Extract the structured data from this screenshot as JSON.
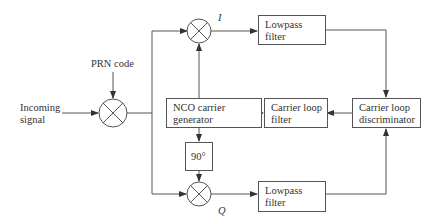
{
  "diagram": {
    "title": "",
    "inputs": {
      "incoming_signal": "Incoming\nsignal",
      "prn_code": "PRN code"
    },
    "branch_labels": {
      "i": "I",
      "q": "Q"
    },
    "blocks": {
      "lowpass_i": "Lowpass\nfilter",
      "lowpass_q": "Lowpass\nfilter",
      "nco": "NCO carrier\ngenerator",
      "loop_filter": "Carrier loop\nfilter",
      "discriminator": "Carrier loop\ndiscriminator",
      "phase_shift": "90°"
    },
    "colors": {
      "line": "#555555",
      "text": "#333333",
      "background": "#ffffff"
    }
  }
}
